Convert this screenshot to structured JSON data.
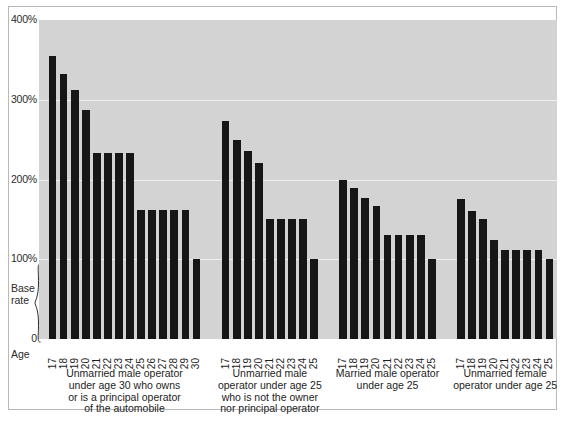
{
  "chart_data": {
    "type": "bar",
    "title": "",
    "subtitle": "",
    "xlabel": "Age",
    "ylabel": "",
    "ylim": [
      0,
      400
    ],
    "grid": true,
    "legend_position": "none",
    "y_ticks": [
      {
        "value": 400,
        "label": "400%"
      },
      {
        "value": 300,
        "label": "300%"
      },
      {
        "value": 200,
        "label": "200%"
      },
      {
        "value": 100,
        "label": "100%"
      },
      {
        "value": 0,
        "label": "0"
      }
    ],
    "annotations": [
      {
        "name": "base-rate-brace",
        "label": "Base\nrate",
        "from": 0,
        "to": 100
      }
    ],
    "groups": [
      {
        "label": "Unmarried male operator\nunder age 30 who owns\nor is a principal operator\nof the automobile",
        "categories": [
          "17",
          "18",
          "19",
          "20",
          "21",
          "22",
          "23",
          "24",
          "25",
          "26",
          "27",
          "28",
          "29",
          "30"
        ],
        "values": [
          355,
          332,
          312,
          287,
          233,
          233,
          233,
          233,
          162,
          162,
          162,
          162,
          162,
          100
        ]
      },
      {
        "label": "Unmarried male\noperator under age 25\nwho is not the owner\nnor principal operator",
        "categories": [
          "17",
          "18",
          "19",
          "20",
          "21",
          "22",
          "23",
          "24",
          "25"
        ],
        "values": [
          273,
          250,
          236,
          221,
          150,
          150,
          150,
          150,
          100
        ]
      },
      {
        "label": "Married male operator\nunder age 25",
        "categories": [
          "17",
          "18",
          "19",
          "20",
          "21",
          "22",
          "23",
          "24",
          "25"
        ],
        "values": [
          199,
          189,
          177,
          167,
          131,
          131,
          131,
          131,
          100
        ]
      },
      {
        "label": "Unmarried female\noperator under age 25",
        "categories": [
          "17",
          "18",
          "19",
          "20",
          "21",
          "22",
          "23",
          "24",
          "25"
        ],
        "values": [
          176,
          160,
          150,
          124,
          111,
          111,
          111,
          111,
          100
        ]
      }
    ],
    "colors": {
      "bar": "#161616",
      "plot_background": "#d3d3d3",
      "gridline": "#efefef",
      "figure_background": "#ffffff",
      "border": "#b9b9b9",
      "text": "#1d1d1d"
    }
  }
}
